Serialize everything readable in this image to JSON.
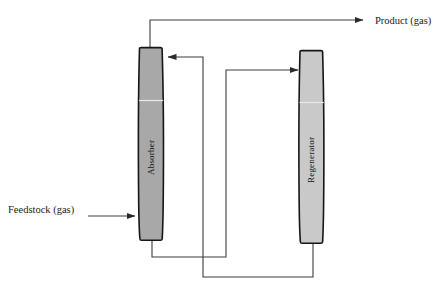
{
  "diagram": {
    "background_color": "#ffffff",
    "line_color": "#3d3d3d",
    "outline_color": "#1a1a1a",
    "units": {
      "absorber": {
        "label": "Absorber",
        "fill_color": "#a8a8a8",
        "seam_color": "#e8e8e8"
      },
      "regenerator": {
        "label": "Regenerator",
        "fill_color": "#c9c9c9",
        "seam_color": "#e8e8e8"
      }
    },
    "streams": [
      {
        "name": "product-gas",
        "label": "Product (gas)",
        "from": "absorber-top",
        "to": "outside-right",
        "arrow": true
      },
      {
        "name": "feedstock-gas",
        "label": "Feedstock (gas)",
        "from": "outside-left",
        "to": "absorber-lower",
        "arrow": true
      },
      {
        "name": "lean-solvent-return",
        "label": "",
        "from": "regenerator-bottom",
        "to": "absorber-top",
        "arrow": true
      },
      {
        "name": "rich-solvent-feed",
        "label": "",
        "from": "absorber-bottom",
        "to": "regenerator-upper",
        "arrow": true
      }
    ]
  }
}
